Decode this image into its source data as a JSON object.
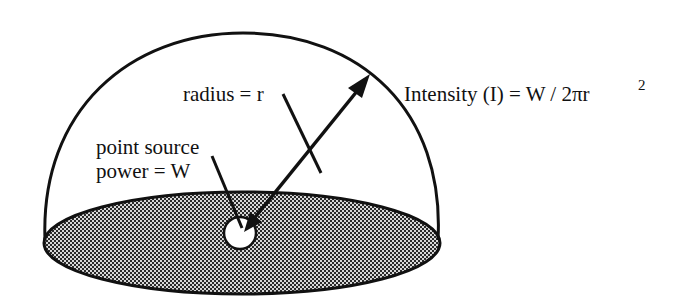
{
  "diagram": {
    "labels": {
      "radius": "radius = r",
      "source_line1": "point source",
      "source_line2": "power = W",
      "intensity_main": "Intensity (I) = W / 2πr",
      "intensity_exponent": "2"
    },
    "colors": {
      "stroke": "#111111",
      "base_fill": "#555555",
      "background": "#ffffff",
      "source_fill": "#ffffff"
    },
    "elements": [
      {
        "id": "hemisphere-dome",
        "type": "arc"
      },
      {
        "id": "base-disk",
        "type": "ellipse",
        "fill": "halftone-gray"
      },
      {
        "id": "point-source",
        "type": "circle"
      },
      {
        "id": "radius-arrow",
        "type": "arrow"
      },
      {
        "id": "radius-leader",
        "type": "line"
      },
      {
        "id": "source-leader",
        "type": "line"
      }
    ]
  }
}
